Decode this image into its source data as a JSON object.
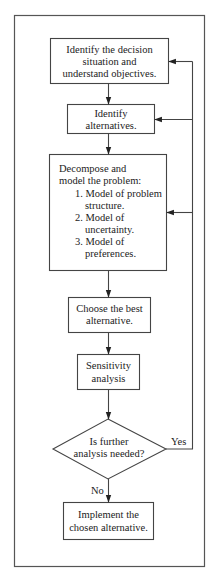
{
  "diagram": {
    "type": "flowchart",
    "nodes": [
      {
        "id": "identify-situation",
        "shape": "box",
        "lines": [
          "Identify the decision",
          "situation and",
          "understand objectives."
        ]
      },
      {
        "id": "identify-alternatives",
        "shape": "box",
        "lines": [
          "Identify",
          "alternatives."
        ]
      },
      {
        "id": "decompose-model",
        "shape": "box",
        "lines": [
          "Decompose and",
          "model the problem:",
          "1. Model of problem",
          "structure.",
          "2. Model of",
          "uncertainty.",
          "3. Model of",
          "preferences."
        ]
      },
      {
        "id": "choose-best",
        "shape": "box",
        "lines": [
          "Choose the best",
          "alternative."
        ]
      },
      {
        "id": "sensitivity-analysis",
        "shape": "box",
        "lines": [
          "Sensitivity",
          "analysis"
        ]
      },
      {
        "id": "further-analysis",
        "shape": "diamond",
        "lines": [
          "Is further",
          "analysis needed?"
        ]
      },
      {
        "id": "implement",
        "shape": "box",
        "lines": [
          "Implement the",
          "chosen alternative."
        ]
      }
    ],
    "edges": [
      {
        "from": "identify-situation",
        "to": "identify-alternatives"
      },
      {
        "from": "identify-alternatives",
        "to": "decompose-model"
      },
      {
        "from": "decompose-model",
        "to": "choose-best"
      },
      {
        "from": "choose-best",
        "to": "sensitivity-analysis"
      },
      {
        "from": "sensitivity-analysis",
        "to": "further-analysis"
      },
      {
        "from": "further-analysis",
        "to": "implement",
        "label": "No"
      },
      {
        "from": "further-analysis",
        "to": "identify-situation",
        "label": "Yes"
      },
      {
        "from": "further-analysis",
        "to": "identify-alternatives",
        "label": "Yes"
      },
      {
        "from": "further-analysis",
        "to": "decompose-model",
        "label": "Yes"
      }
    ],
    "labels": {
      "yes": "Yes",
      "no": "No"
    }
  }
}
